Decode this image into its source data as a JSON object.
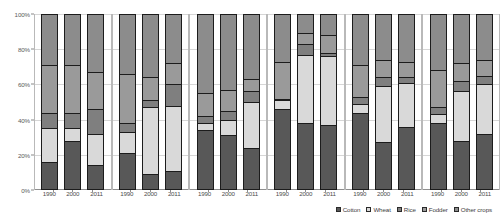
{
  "chart_data": {
    "type": "bar",
    "subtype": "stacked-100-percent-small-multiples",
    "title": "",
    "xlabel": "",
    "ylabel": "",
    "ylim": [
      0,
      100
    ],
    "ytick_labels": [
      "0%",
      "20%",
      "40%",
      "60%",
      "80%",
      "100%"
    ],
    "ytick_values": [
      0,
      20,
      40,
      60,
      80,
      100
    ],
    "grid": true,
    "legend_position": "bottom-right",
    "categories": [
      "1990",
      "2000",
      "2011"
    ],
    "series": [
      {
        "name": "Cotton",
        "color": "#585858"
      },
      {
        "name": "Wheat",
        "color": "#d9d9d9"
      },
      {
        "name": "Rice",
        "color": "#7f7f7f"
      },
      {
        "name": "Fodder",
        "color": "#9a9a9a"
      },
      {
        "name": "Other crops",
        "color": "#8c8c8c"
      }
    ],
    "panels": [
      {
        "name": "panel-1",
        "bars": [
          {
            "year": "1990",
            "values": {
              "Cotton": 16,
              "Wheat": 19,
              "Rice": 9,
              "Fodder": 27,
              "Other crops": 29
            }
          },
          {
            "year": "2000",
            "values": {
              "Cotton": 28,
              "Wheat": 7,
              "Rice": 9,
              "Fodder": 27,
              "Other crops": 29
            }
          },
          {
            "year": "2011",
            "values": {
              "Cotton": 14,
              "Wheat": 18,
              "Rice": 14,
              "Fodder": 21,
              "Other crops": 33
            }
          }
        ]
      },
      {
        "name": "panel-2",
        "bars": [
          {
            "year": "1990",
            "values": {
              "Cotton": 21,
              "Wheat": 12,
              "Rice": 5,
              "Fodder": 28,
              "Other crops": 34
            }
          },
          {
            "year": "2000",
            "values": {
              "Cotton": 9,
              "Wheat": 38,
              "Rice": 4,
              "Fodder": 13,
              "Other crops": 36
            }
          },
          {
            "year": "2011",
            "values": {
              "Cotton": 11,
              "Wheat": 37,
              "Rice": 12,
              "Fodder": 12,
              "Other crops": 28
            }
          }
        ]
      },
      {
        "name": "panel-3",
        "bars": [
          {
            "year": "1990",
            "values": {
              "Cotton": 34,
              "Wheat": 4,
              "Rice": 4,
              "Fodder": 13,
              "Other crops": 45
            }
          },
          {
            "year": "2000",
            "values": {
              "Cotton": 31,
              "Wheat": 9,
              "Rice": 5,
              "Fodder": 12,
              "Other crops": 43
            }
          },
          {
            "year": "2011",
            "values": {
              "Cotton": 24,
              "Wheat": 26,
              "Rice": 6,
              "Fodder": 7,
              "Other crops": 37
            }
          }
        ]
      },
      {
        "name": "panel-4",
        "bars": [
          {
            "year": "1990",
            "values": {
              "Cotton": 46,
              "Wheat": 5,
              "Rice": 1,
              "Fodder": 21,
              "Other crops": 27
            }
          },
          {
            "year": "2000",
            "values": {
              "Cotton": 38,
              "Wheat": 39,
              "Rice": 6,
              "Fodder": 6,
              "Other crops": 11
            }
          },
          {
            "year": "2011",
            "values": {
              "Cotton": 37,
              "Wheat": 39,
              "Rice": 2,
              "Fodder": 10,
              "Other crops": 12
            }
          }
        ]
      },
      {
        "name": "panel-5",
        "bars": [
          {
            "year": "1990",
            "values": {
              "Cotton": 44,
              "Wheat": 5,
              "Rice": 4,
              "Fodder": 18,
              "Other crops": 29
            }
          },
          {
            "year": "2000",
            "values": {
              "Cotton": 27,
              "Wheat": 32,
              "Rice": 5,
              "Fodder": 10,
              "Other crops": 26
            }
          },
          {
            "year": "2011",
            "values": {
              "Cotton": 36,
              "Wheat": 25,
              "Rice": 3,
              "Fodder": 9,
              "Other crops": 27
            }
          }
        ]
      },
      {
        "name": "panel-6",
        "bars": [
          {
            "year": "1990",
            "values": {
              "Cotton": 38,
              "Wheat": 5,
              "Rice": 4,
              "Fodder": 21,
              "Other crops": 32
            }
          },
          {
            "year": "2000",
            "values": {
              "Cotton": 28,
              "Wheat": 28,
              "Rice": 6,
              "Fodder": 10,
              "Other crops": 28
            }
          },
          {
            "year": "2011",
            "values": {
              "Cotton": 32,
              "Wheat": 28,
              "Rice": 5,
              "Fodder": 9,
              "Other crops": 26
            }
          }
        ]
      }
    ]
  },
  "legend": {
    "items": [
      {
        "label": "Cotton"
      },
      {
        "label": "Wheat"
      },
      {
        "label": "Rice"
      },
      {
        "label": "Fodder"
      },
      {
        "label": "Other crops"
      }
    ]
  }
}
